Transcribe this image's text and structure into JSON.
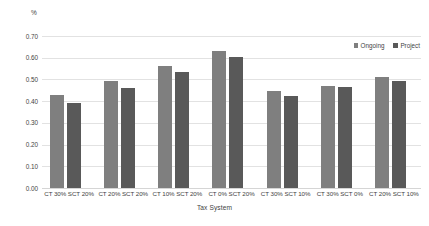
{
  "chart_data": {
    "type": "bar",
    "title": "",
    "xlabel": "Tax System",
    "ylabel": "%",
    "ylim": [
      0.0,
      0.7
    ],
    "ytick_step": 0.1,
    "grid": true,
    "legend_position": "top-right",
    "categories": [
      "CT 30% SCT 20%",
      "CT 20% SCT 20%",
      "CT 10% SCT 20%",
      "CT 0% SCT 20%",
      "CT 30% SCT 10%",
      "CT 30% SCT 0%",
      "CT 20% SCT 10%"
    ],
    "ytick_labels": [
      "0.70",
      "0.60",
      "0.50",
      "0.40",
      "0.30",
      "0.20",
      "0.10",
      "0.00"
    ],
    "series": [
      {
        "name": "Ongoing",
        "color": "#7f7f7f",
        "values": [
          0.427,
          0.494,
          0.562,
          0.629,
          0.445,
          0.468,
          0.511
        ]
      },
      {
        "name": "Project",
        "color": "#595959",
        "values": [
          0.393,
          0.462,
          0.532,
          0.602,
          0.425,
          0.463,
          0.494
        ]
      }
    ]
  },
  "legend": {
    "items": [
      {
        "label": "Ongoing",
        "marker": "legend-swatch-ongoing"
      },
      {
        "label": "Project",
        "marker": "legend-swatch-project"
      }
    ]
  }
}
